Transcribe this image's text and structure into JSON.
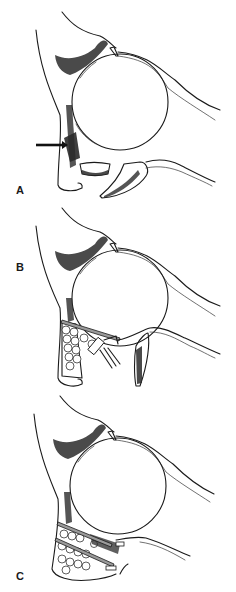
{
  "figure": {
    "panels": [
      {
        "label": "A",
        "description": "Orbit cross-section with fractured orbital floor; arrow indicates inferior orbital rim fracture; floor fragments displaced",
        "annotations": [
          "arrow-pointing-to-orbital-rim"
        ]
      },
      {
        "label": "B",
        "description": "Orbit with bone graft packed at orbital rim/floor, plate placed, screw/instrument inserted; displaced fragment",
        "annotations": [
          "plate",
          "bone-graft",
          "screw-instrument"
        ]
      },
      {
        "label": "C",
        "description": "Reconstructed orbital floor with bone graft and two plates fixed",
        "annotations": [
          "plate-upper",
          "plate-lower",
          "bone-graft"
        ]
      }
    ]
  },
  "colors": {
    "line": "#1a1a1a",
    "plate": "#9a9a9a",
    "background": "#ffffff"
  }
}
